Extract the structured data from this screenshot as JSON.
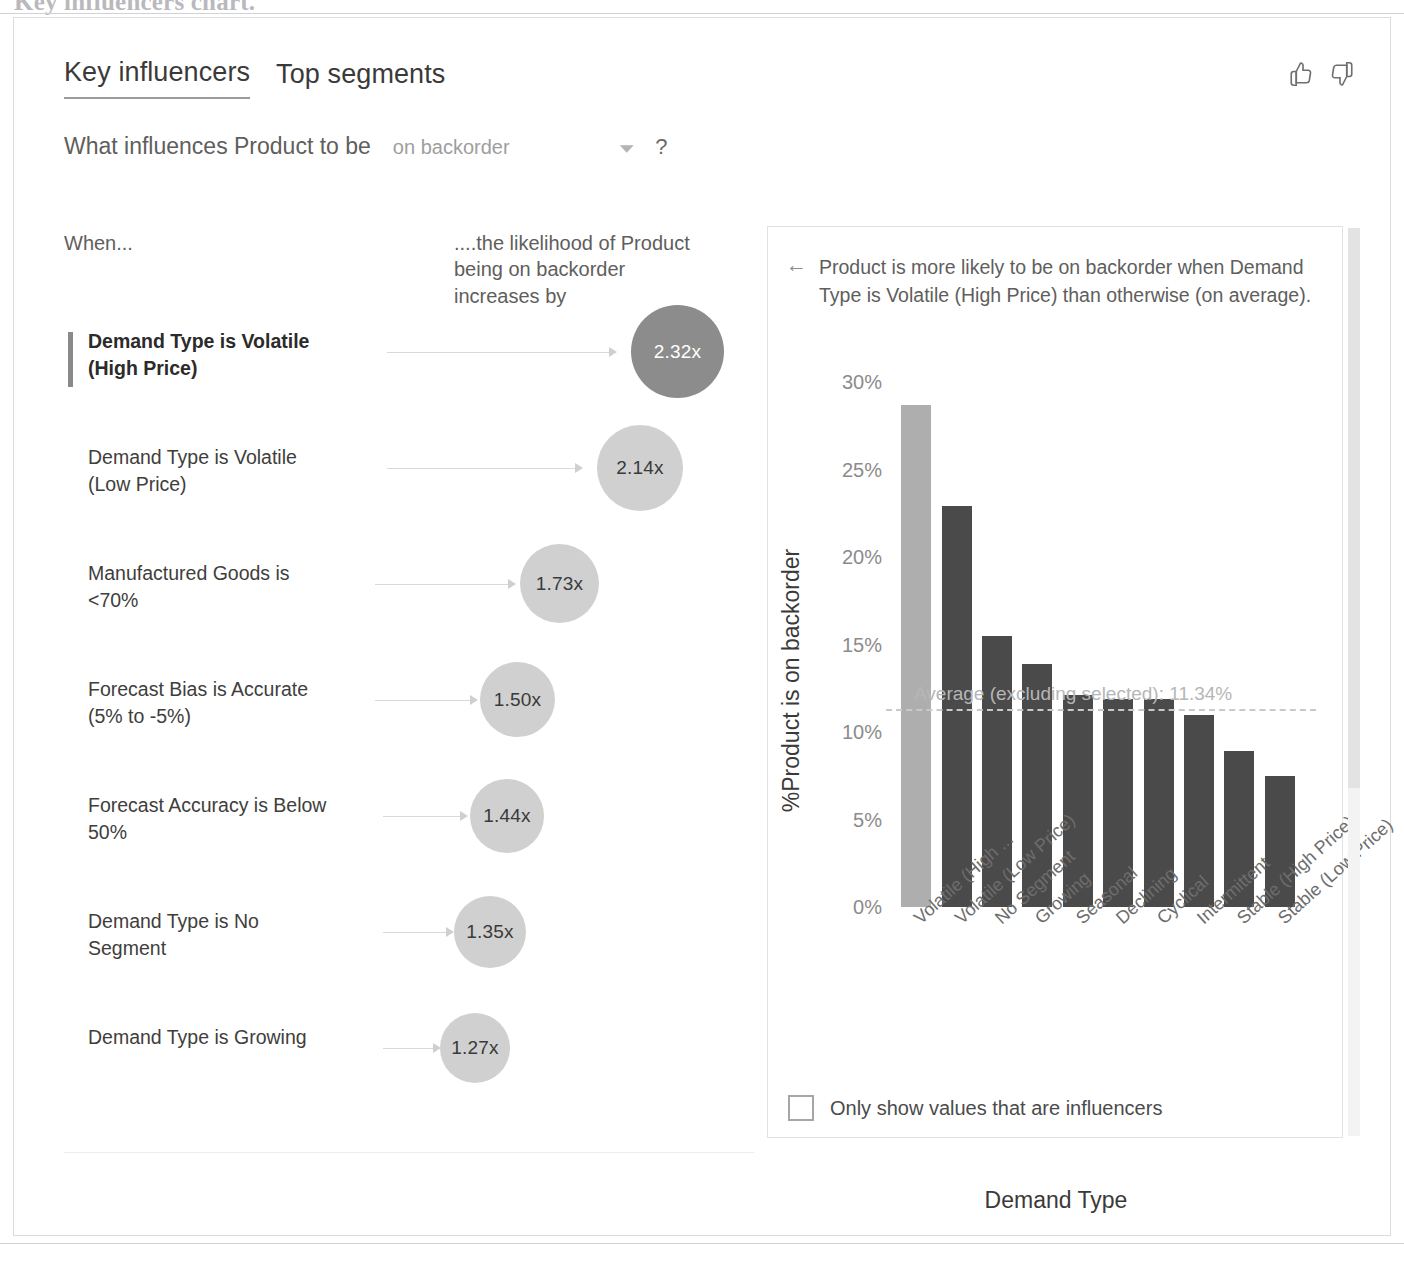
{
  "document": {
    "heading": "Key influencers chart."
  },
  "visual": {
    "tabs": [
      {
        "label": "Key influencers",
        "active": true
      },
      {
        "label": "Top segments",
        "active": false
      }
    ],
    "feedback": {
      "like_icon": "thumbs-up-icon",
      "dislike_icon": "thumbs-down-icon"
    },
    "question": {
      "prefix": "What influences Product to be",
      "selected_value": "on backorder",
      "dropdown_icon": "chevron-down-icon",
      "help_icon": "?"
    },
    "columns": {
      "when": "When...",
      "likelihood": "....the likelihood of Product being on backorder increases by"
    },
    "influencers": [
      {
        "label": "Demand Type is Volatile\n(High Price)",
        "value": "2.32x",
        "selected": true,
        "bubble_px": 93,
        "bubble_left": 631,
        "bubble_top": -17,
        "conn_left": 387,
        "conn_width": 222
      },
      {
        "label": "Demand Type is Volatile\n(Low Price)",
        "value": "2.14x",
        "selected": false,
        "bubble_px": 86,
        "bubble_left": 597,
        "bubble_top": -13,
        "conn_left": 387,
        "conn_width": 188
      },
      {
        "label": "Manufactured Goods is\n<70%",
        "value": "1.73x",
        "selected": false,
        "bubble_px": 79,
        "bubble_left": 520,
        "bubble_top": -10,
        "conn_left": 375,
        "conn_width": 133
      },
      {
        "label": "Forecast Bias is Accurate\n(5% to -5%)",
        "value": "1.50x",
        "selected": false,
        "bubble_px": 75,
        "bubble_left": 480,
        "bubble_top": -8,
        "conn_left": 375,
        "conn_width": 95
      },
      {
        "label": "Forecast Accuracy is Below\n50%",
        "value": "1.44x",
        "selected": false,
        "bubble_px": 74,
        "bubble_left": 470,
        "bubble_top": -7,
        "conn_left": 383,
        "conn_width": 77
      },
      {
        "label": "Demand Type is No\nSegment",
        "value": "1.35x",
        "selected": false,
        "bubble_px": 72,
        "bubble_left": 454,
        "bubble_top": -6,
        "conn_left": 383,
        "conn_width": 63
      },
      {
        "label": "Demand Type is Growing",
        "value": "1.27x",
        "selected": false,
        "bubble_px": 70,
        "bubble_left": 440,
        "bubble_top": -5,
        "conn_left": 383,
        "conn_width": 50
      }
    ],
    "detail": {
      "back_icon": "back-arrow-icon",
      "description": "Product is more likely to be on backorder when Demand Type is Volatile (High Price) than otherwise (on average)."
    },
    "checkbox": {
      "label": "Only show values that are influencers",
      "checked": false
    },
    "scrollbar": "vertical-scrollbar"
  },
  "chart_data": {
    "type": "bar",
    "title": "",
    "xlabel": "Demand Type",
    "ylabel": "%Product is on backorder",
    "ylim": [
      0,
      32
    ],
    "ytick_values": [
      30,
      25,
      20,
      15,
      10,
      5,
      0
    ],
    "ytick_labels": [
      "30%",
      "25%",
      "20%",
      "15%",
      "10%",
      "5%",
      "0%"
    ],
    "grid": false,
    "legend": "none",
    "categories": [
      "Volatile (High ...",
      "Volatile (Low Price)",
      "No Segment",
      "Growing",
      "Seasonal",
      "Declining",
      "Cyclical",
      "Intermittent",
      "Stable (High Price)",
      "Stable (Low Price)"
    ],
    "values": [
      28.7,
      22.9,
      15.5,
      13.9,
      12.1,
      11.9,
      11.9,
      11.0,
      8.9,
      7.5
    ],
    "highlight_index": 0,
    "reference_line": {
      "label": "Average (excluding selected): 11.34%",
      "value": 11.34
    }
  }
}
